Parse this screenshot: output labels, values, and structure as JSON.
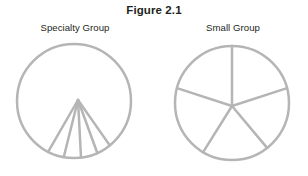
{
  "figure": {
    "title": "Figure 2.1",
    "background_color": "#ffffff",
    "stroke_color": "#b5b5b5",
    "stroke_width": 2.5,
    "text_color": "#231f20"
  },
  "panels": [
    {
      "id": "specialty-group",
      "label": "Specialty Group",
      "shape": "circle",
      "center": {
        "x": 74,
        "y": 101
      },
      "radius": 57,
      "divisions": 4,
      "hub": {
        "x": 78,
        "y": 100
      },
      "description": "Circle with a narrow downward fan of five radii from an off-center hub, forming four thin wedges",
      "ray_angles_deg": [
        55,
        70,
        87,
        104,
        120
      ]
    },
    {
      "id": "small-group",
      "label": "Small Group",
      "shape": "circle",
      "center": {
        "x": 232,
        "y": 103
      },
      "radius": 57,
      "divisions": 5,
      "hub": {
        "x": 232,
        "y": 106
      },
      "description": "Circle divided into five roughly equal pie sectors from a near-center hub",
      "ray_angles_deg": [
        -90,
        -18,
        50,
        122,
        198
      ]
    }
  ],
  "chart_data": {
    "type": "pie",
    "title": "Figure 2.1",
    "xlabel": "",
    "ylabel": "",
    "legend_position": "none",
    "grid": false,
    "charts": [
      {
        "name": "Specialty Group",
        "categories": [
          "Segment 1",
          "Segment 2",
          "Segment 3",
          "Segment 4"
        ],
        "values": [
          16,
          17,
          17,
          15
        ],
        "note": "Four narrow adjacent wedges at the bottom of the circle; remainder of the disc is undivided"
      },
      {
        "name": "Small Group",
        "categories": [
          "Segment 1",
          "Segment 2",
          "Segment 3",
          "Segment 4",
          "Segment 5"
        ],
        "values": [
          72,
          68,
          72,
          76,
          72
        ],
        "note": "Five roughly equal sectors spanning the full circle"
      }
    ]
  }
}
